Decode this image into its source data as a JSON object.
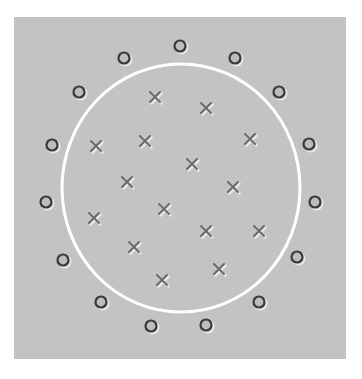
{
  "diagram": {
    "title": "",
    "panel": {
      "x": 14,
      "y": 17,
      "width": 332,
      "height": 342,
      "fill": "#c3c3c3"
    },
    "boundary": {
      "shape": "circle",
      "cx": 181,
      "cy": 188,
      "rx": 119,
      "ry": 124,
      "stroke": "#ffffff",
      "stroke_width": 3
    },
    "marker_colors": {
      "circle": "#3a3a3a",
      "cross": "#6a6a6a",
      "shadow": "#e8e8e8"
    },
    "classes": [
      {
        "name": "outside",
        "marker": "circle-marker",
        "count": 18
      },
      {
        "name": "inside",
        "marker": "cross-marker",
        "count": 18
      }
    ],
    "circles": [
      [
        180,
        46
      ],
      [
        124,
        58
      ],
      [
        235,
        58
      ],
      [
        79,
        92
      ],
      [
        279,
        92
      ],
      [
        52,
        145
      ],
      [
        309,
        144
      ],
      [
        46,
        202
      ],
      [
        315,
        202
      ],
      [
        63,
        260
      ],
      [
        297,
        257
      ],
      [
        101,
        302
      ],
      [
        259,
        302
      ],
      [
        151,
        326
      ],
      [
        206,
        325
      ]
    ],
    "crosses": [
      [
        155,
        97
      ],
      [
        206,
        108
      ],
      [
        96,
        146
      ],
      [
        145,
        141
      ],
      [
        250,
        139
      ],
      [
        192,
        164
      ],
      [
        127,
        182
      ],
      [
        233,
        187
      ],
      [
        164,
        209
      ],
      [
        94,
        218
      ],
      [
        206,
        231
      ],
      [
        259,
        231
      ],
      [
        134,
        247
      ],
      [
        219,
        269
      ],
      [
        162,
        280
      ]
    ]
  }
}
